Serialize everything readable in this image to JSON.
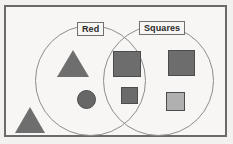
{
  "diagram": {
    "type": "venn",
    "title": "",
    "frame": {
      "border_color": "#6a6a6a",
      "background": "#f7f6f4"
    },
    "sets": [
      {
        "id": "left",
        "label": "Red",
        "outline_color": "#8d8d8d"
      },
      {
        "id": "right",
        "label": "Squares",
        "outline_color": "#8d8d8d"
      }
    ],
    "shapes": [
      {
        "id": "tri-red",
        "kind": "triangle",
        "size": "large",
        "fill": "#6e6e6e",
        "region": "Red only"
      },
      {
        "id": "circ-red",
        "kind": "circle",
        "size": "small",
        "fill": "#676767",
        "region": "Red only"
      },
      {
        "id": "tri-outside",
        "kind": "triangle",
        "size": "large",
        "fill": "#6e6e6e",
        "region": "outside both"
      },
      {
        "id": "sq-overlap-big",
        "kind": "square",
        "size": "large",
        "fill": "#6d6d6d",
        "region": "Red and Squares"
      },
      {
        "id": "sq-overlap-small",
        "kind": "square",
        "size": "small",
        "fill": "#6b6b6b",
        "region": "Red and Squares"
      },
      {
        "id": "sq-right-big",
        "kind": "square",
        "size": "large",
        "fill": "#6d6d6d",
        "region": "Squares only"
      },
      {
        "id": "sq-right-light",
        "kind": "square",
        "size": "small",
        "fill": "#b0b0b0",
        "region": "Squares only"
      }
    ]
  }
}
